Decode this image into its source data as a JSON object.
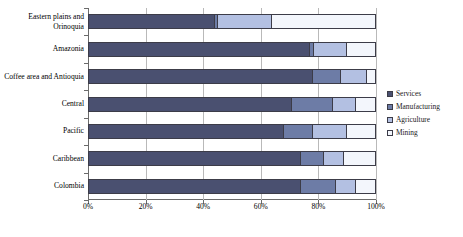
{
  "chart_data": {
    "type": "bar",
    "orientation": "horizontal",
    "stacked": true,
    "stack_mode": "percent",
    "title": "",
    "subtitle": "",
    "xlabel": "",
    "ylabel": "",
    "xlim": [
      0,
      100
    ],
    "xticks": [
      0,
      20,
      40,
      60,
      80,
      100
    ],
    "xtick_labels": [
      "0%",
      "20%",
      "40%",
      "60%",
      "80%",
      "100%"
    ],
    "grid": true,
    "grid_axis": "x",
    "legend_position": "right",
    "categories": [
      "Eastern plains and Orinoquia",
      "Amazonia",
      "Coffee area and Antioquia",
      "Central",
      "Pacific",
      "Caribbean",
      "Colombia"
    ],
    "series": [
      {
        "name": "Services",
        "color": "#4a5070",
        "values": [
          44.0,
          77.0,
          78.0,
          71.0,
          68.0,
          74.0,
          74.0
        ]
      },
      {
        "name": "Manufacturing",
        "color": "#6d7ca6",
        "values": [
          1.0,
          1.5,
          10.0,
          14.0,
          10.0,
          8.0,
          12.0
        ]
      },
      {
        "name": "Agriculture",
        "color": "#b3c0e2",
        "values": [
          19.0,
          11.5,
          9.0,
          8.0,
          12.0,
          7.0,
          7.0
        ]
      },
      {
        "name": "Mining",
        "color": "#f3f6fc",
        "values": [
          36.0,
          10.0,
          3.0,
          7.0,
          10.0,
          11.0,
          7.0
        ]
      }
    ]
  },
  "legend": {
    "items": [
      {
        "label": "Services",
        "color": "#4a5070"
      },
      {
        "label": "Manufacturing",
        "color": "#6d7ca6"
      },
      {
        "label": "Agriculture",
        "color": "#b3c0e2"
      },
      {
        "label": "Mining",
        "color": "#f3f6fc"
      }
    ]
  },
  "axes": {
    "x_tick_labels": [
      "0%",
      "20%",
      "40%",
      "60%",
      "80%",
      "100%"
    ],
    "y_tick_labels": [
      "Eastern plains and Orinoquia",
      "Amazonia",
      "Coffee area and Antioquia",
      "Central",
      "Pacific",
      "Caribbean",
      "Colombia"
    ]
  },
  "colors": {
    "series_services": "#4a5070",
    "series_manufacturing": "#6d7ca6",
    "series_agriculture": "#b3c0e2",
    "series_mining": "#f3f6fc",
    "grid": "#b9b9b9",
    "axis": "#6b6b6b",
    "bar_outline": "#3c3c48",
    "background": "#ffffff"
  }
}
